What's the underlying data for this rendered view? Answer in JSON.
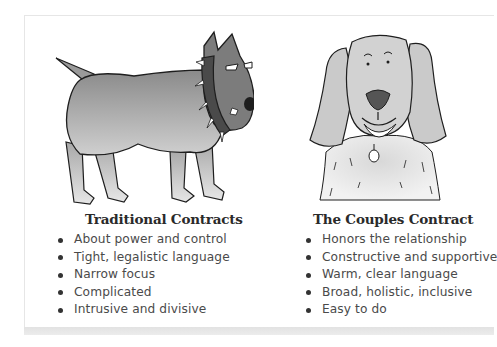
{
  "left": {
    "illustration": "angry-dog-spiked-collar",
    "title": "Traditional Contracts",
    "items": [
      "About power and control",
      "Tight, legalistic language",
      "Narrow focus",
      "Complicated",
      "Intrusive and divisive"
    ]
  },
  "right": {
    "illustration": "friendly-shaggy-dog",
    "title": "The Couples Contract",
    "items": [
      "Honors the relationship",
      "Constructive and supportive",
      "Warm, clear language",
      "Broad, holistic, inclusive",
      "Easy to do"
    ]
  },
  "colors": {
    "text": "#4a4a4a",
    "title": "#2a2a2a",
    "dog_gray": "#8f8f8f",
    "outline": "#1e1e1e"
  }
}
